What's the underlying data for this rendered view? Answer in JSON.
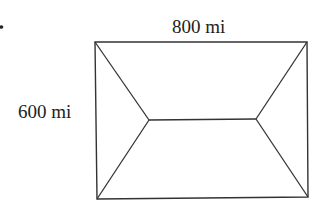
{
  "diagram": {
    "type": "rectangle-with-roof-lines",
    "labels": {
      "width": "800 mi",
      "height": "600 mi"
    },
    "stroke_color": "#333333",
    "dimensions": {
      "width_mi": 800,
      "height_mi": 600
    }
  }
}
